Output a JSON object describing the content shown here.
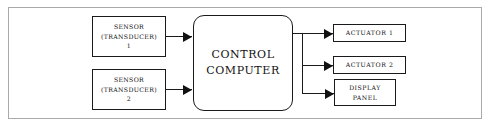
{
  "diagram": {
    "frame": {
      "name": "outer-frame"
    },
    "colors": {
      "background": "#ffffff",
      "node_stroke": "#1a1a1a",
      "frame_stroke": "#a9a9a9",
      "text": "#111111",
      "arrow_fill": "#111111"
    },
    "inputs": [
      {
        "id": "sensor-1",
        "line1": "SENSOR",
        "line2": "(TRANSDUCER)",
        "line3": "1"
      },
      {
        "id": "sensor-2",
        "line1": "SENSOR",
        "line2": "(TRANSDUCER)",
        "line3": "2"
      }
    ],
    "controller": {
      "id": "control-computer",
      "line1": "CONTROL",
      "line2": "COMPUTER",
      "shape": "rounded-rectangle"
    },
    "outputs": [
      {
        "id": "actuator-1",
        "line1": "ACTUATOR 1",
        "line2": ""
      },
      {
        "id": "actuator-2",
        "line1": "ACTUATOR 2",
        "line2": ""
      },
      {
        "id": "display-panel",
        "line1": "DISPLAY",
        "line2": "PANEL"
      }
    ],
    "connectors": [
      {
        "name": "sensor-1-to-controller",
        "direction": "right"
      },
      {
        "name": "sensor-2-to-controller",
        "direction": "right"
      },
      {
        "name": "controller-output-bus",
        "direction": "vertical"
      },
      {
        "name": "controller-to-actuator-1",
        "direction": "right"
      },
      {
        "name": "controller-to-actuator-2",
        "direction": "right"
      },
      {
        "name": "controller-to-display-panel",
        "direction": "right"
      }
    ]
  }
}
